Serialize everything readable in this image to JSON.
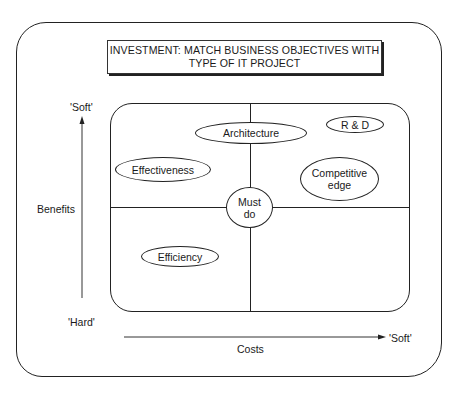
{
  "title": {
    "line1": "INVESTMENT: MATCH BUSINESS OBJECTIVES WITH",
    "line2": "TYPE OF IT PROJECT"
  },
  "y_axis": {
    "label": "Benefits",
    "top_label": "'Soft'",
    "bottom_label": "'Hard'"
  },
  "x_axis": {
    "label": "Costs",
    "end_label": "'Soft'"
  },
  "categories": {
    "architecture": "Architecture",
    "rnd": "R & D",
    "effectiveness": "Effectiveness",
    "competitive_line1": "Competitive",
    "competitive_line2": "edge",
    "must_do_line1": "Must",
    "must_do_line2": "do",
    "efficiency": "Efficiency"
  },
  "colors": {
    "line": "#222222",
    "background": "#ffffff"
  }
}
